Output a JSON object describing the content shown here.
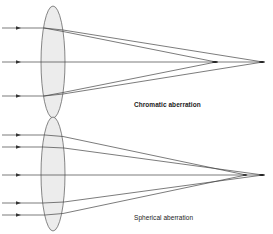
{
  "colors": {
    "background": "#ffffff",
    "ray": "#444444",
    "lens_fill": "#ececec",
    "lens_stroke": "#555555",
    "text": "#222222"
  },
  "panels": [
    {
      "id": "chromatic",
      "caption": "Chromatic aberration",
      "lens": {
        "cx": 53,
        "cy": 62,
        "rx": 12,
        "ry": 56
      },
      "axis_y": 62,
      "focal_points": [
        {
          "x": 216,
          "y": 62
        },
        {
          "x": 263,
          "y": 62
        }
      ],
      "incoming_rays_y": [
        28,
        62,
        96
      ]
    },
    {
      "id": "spherical",
      "caption": "Spherical aberration",
      "lens": {
        "cx": 53,
        "cy": 174,
        "rx": 12,
        "ry": 57
      },
      "axis_y": 175,
      "focal_points": [
        {
          "x": 246,
          "y": 175
        },
        {
          "x": 263,
          "y": 175
        }
      ],
      "incoming_rays_y": [
        135,
        147,
        175,
        203,
        215
      ]
    }
  ]
}
